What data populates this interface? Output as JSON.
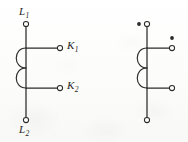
{
  "figure": {
    "background_color": "#fdfdfc",
    "line_color": "#2b2b2b"
  },
  "left_circuit": {
    "name": "labeled-winding-diagram",
    "primary_line": {
      "x": 26,
      "y_top": 24,
      "y_bottom": 120
    },
    "terminals": [
      {
        "id": "L1",
        "label": "L",
        "subscript": "1",
        "cx": 26,
        "cy": 24,
        "r": 2.6,
        "type": "open"
      },
      {
        "id": "K1",
        "label": "K",
        "subscript": "1",
        "cx": 60,
        "cy": 48,
        "r": 2.6,
        "type": "open"
      },
      {
        "id": "K2",
        "label": "K",
        "subscript": "2",
        "cx": 60,
        "cy": 88,
        "r": 2.6,
        "type": "open"
      },
      {
        "id": "L2",
        "label": "L",
        "subscript": "2",
        "cx": 26,
        "cy": 120,
        "r": 2.6,
        "type": "open"
      }
    ],
    "labels": [
      {
        "id": "L1-label",
        "text": "L",
        "subscript": "1",
        "x": 19,
        "y": 6
      },
      {
        "id": "K1-label",
        "text": "K",
        "subscript": "1",
        "x": 67,
        "y": 40
      },
      {
        "id": "K2-label",
        "text": "K",
        "subscript": "2",
        "x": 67,
        "y": 80
      },
      {
        "id": "L2-label",
        "text": "L",
        "subscript": "2",
        "x": 19,
        "y": 124
      }
    ],
    "branches": [
      {
        "id": "K1-branch",
        "x1": 26,
        "y1": 48,
        "x2": 57,
        "y2": 48
      },
      {
        "id": "K2-branch",
        "x1": 26,
        "y1": 88,
        "x2": 57,
        "y2": 88
      }
    ],
    "coil_arcs": [
      {
        "id": "coil-turn-upper",
        "x": 26,
        "y_start": 48,
        "y_end": 68,
        "bulge": 13
      },
      {
        "id": "coil-turn-lower",
        "x": 26,
        "y_start": 68,
        "y_end": 88,
        "bulge": 13
      }
    ]
  },
  "right_circuit": {
    "name": "polarity-dot-winding-diagram",
    "primary_line": {
      "x": 147,
      "y_top": 24,
      "y_bottom": 120
    },
    "terminals": [
      {
        "id": "RT-top",
        "cx": 147,
        "cy": 24,
        "r": 2.6,
        "type": "open"
      },
      {
        "id": "RT-branch-1",
        "cx": 172,
        "cy": 48,
        "r": 2.6,
        "type": "open"
      },
      {
        "id": "RT-branch-2",
        "cx": 172,
        "cy": 88,
        "r": 2.6,
        "type": "open"
      },
      {
        "id": "RT-bottom",
        "cx": 147,
        "cy": 120,
        "r": 2.6,
        "type": "open"
      }
    ],
    "polarity_dots": [
      {
        "id": "dot-primary",
        "cx": 139,
        "cy": 24,
        "r": 1.9
      },
      {
        "id": "dot-secondary",
        "cx": 172,
        "cy": 38,
        "r": 1.9
      }
    ],
    "branches": [
      {
        "id": "right-branch-upper",
        "x1": 147,
        "y1": 48,
        "x2": 169,
        "y2": 48
      },
      {
        "id": "right-branch-lower",
        "x1": 147,
        "y1": 88,
        "x2": 169,
        "y2": 88
      }
    ],
    "coil_arcs": [
      {
        "id": "coil-turn-upper",
        "x": 147,
        "y_start": 48,
        "y_end": 68,
        "bulge": 13
      },
      {
        "id": "coil-turn-lower",
        "x": 147,
        "y_start": 68,
        "y_end": 88,
        "bulge": 13
      }
    ]
  }
}
